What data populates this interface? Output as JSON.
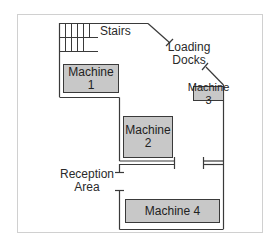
{
  "diagram": {
    "type": "floor-plan",
    "labels": {
      "stairs": "Stairs",
      "loading_docks_line1": "Loading",
      "loading_docks_line2": "Docks",
      "reception_line1": "Reception",
      "reception_line2": "Area"
    },
    "machines": [
      {
        "id": 1,
        "line1": "Machine",
        "line2": "1"
      },
      {
        "id": 2,
        "line1": "Machine",
        "line2": "2"
      },
      {
        "id": 3,
        "line1": "Machine 3",
        "line2": ""
      },
      {
        "id": 4,
        "line1": "Machine 4",
        "line2": ""
      }
    ],
    "colors": {
      "machine_fill": "#c8c8c8",
      "wall": "#3a3a3a",
      "frame": "#d0d0d0"
    }
  }
}
